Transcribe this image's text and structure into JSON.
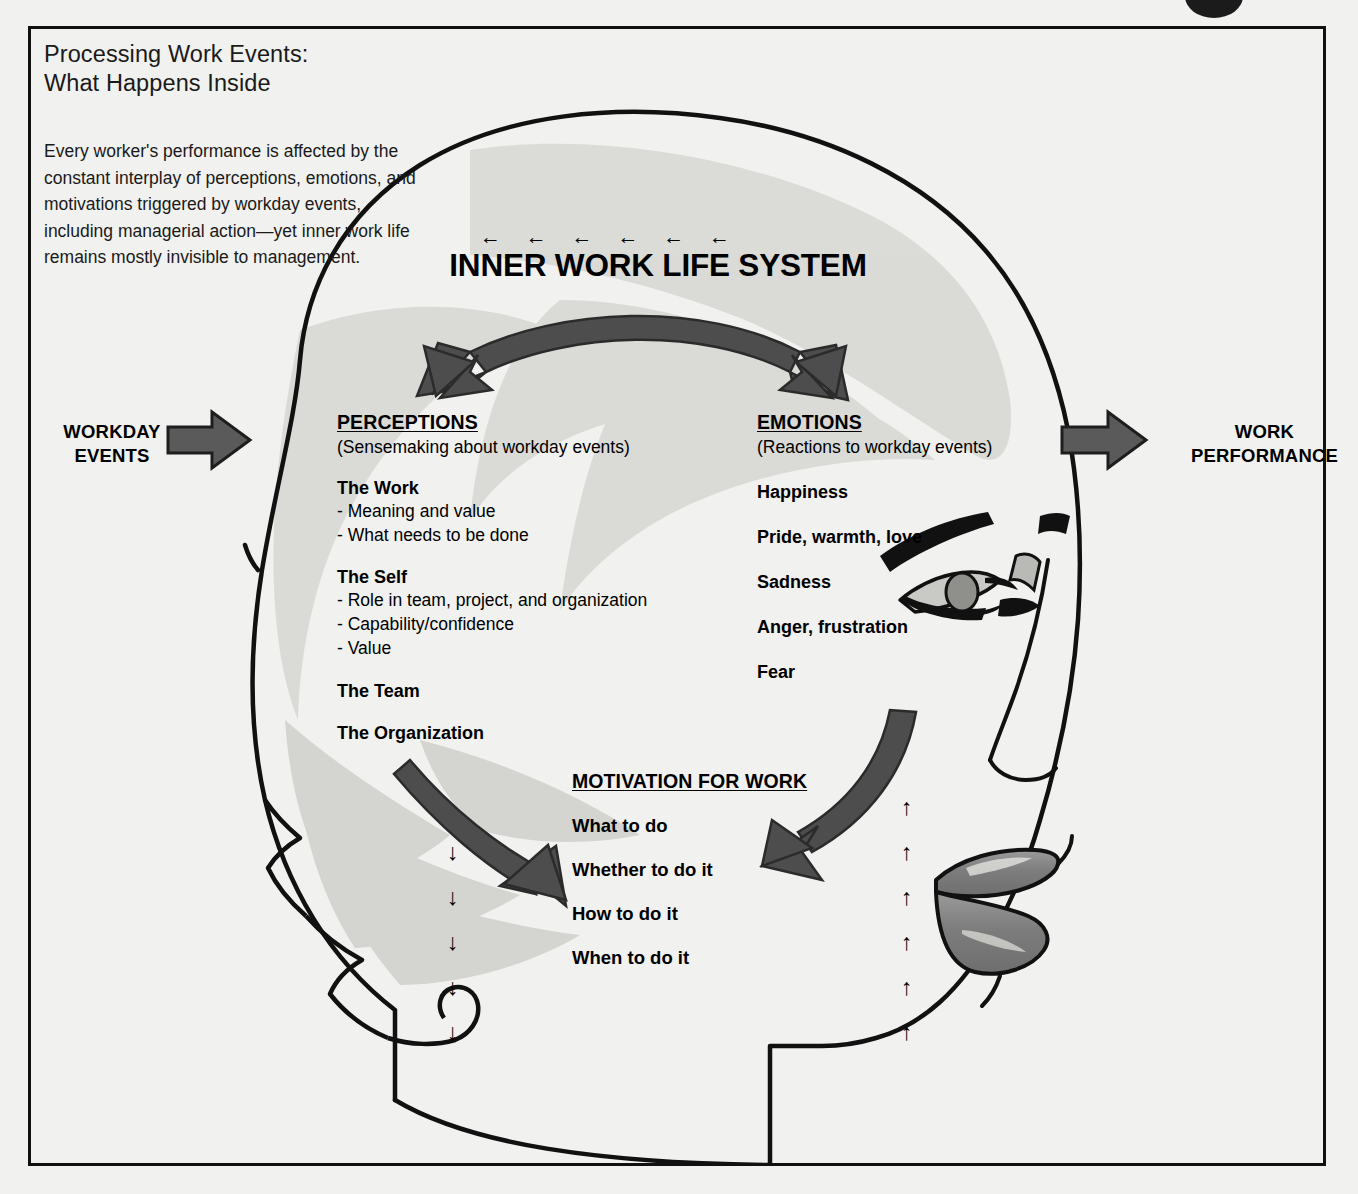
{
  "document": {
    "title_line1": "Processing Work Events:",
    "title_line2": "What Happens Inside",
    "description": "Every worker's performance is affected by the constant interplay of perceptions, emotions, and motivations triggered by workday events, including managerial action—yet inner work life remains mostly invisible to management."
  },
  "system": {
    "title": "INNER WORK LIFE SYSTEM",
    "inflow_arrow_count": 6,
    "inflow_arrow_glyph": "←"
  },
  "flow": {
    "input_label_line1": "WORKDAY",
    "input_label_line2": "EVENTS",
    "output_label_line1": "WORK",
    "output_label_line2": "PERFORMANCE"
  },
  "perceptions": {
    "heading": "PERCEPTIONS",
    "subtitle": "(Sensemaking about workday events)",
    "groups": [
      {
        "label": "The Work",
        "items": [
          "- Meaning and value",
          "- What needs to be done"
        ]
      },
      {
        "label": "The Self",
        "items": [
          "- Role in team, project, and organization",
          "- Capability/confidence",
          "- Value"
        ]
      },
      {
        "label": "The Team",
        "items": []
      },
      {
        "label": "The Organization",
        "items": []
      }
    ]
  },
  "emotions": {
    "heading": "EMOTIONS",
    "subtitle": "(Reactions to workday events)",
    "items": [
      "Happiness",
      "Pride, warmth, love",
      "Sadness",
      "Anger, frustration",
      "Fear"
    ]
  },
  "motivation": {
    "heading": "MOTIVATION FOR WORK",
    "items": [
      "What to do",
      "Whether to do it",
      "How to do it",
      "When to do it"
    ]
  },
  "tick_arrows": {
    "down_glyph": "↓",
    "down_count": 5,
    "up_glyph": "↑",
    "up_count": 6
  },
  "colors": {
    "page_background": "#f1f1ef",
    "ink": "#111111",
    "arrow_gray": "#4d4d4d",
    "hair_gray": "#cfcfcb",
    "lip_gray": "#8a8a8a",
    "border": "#111111"
  }
}
